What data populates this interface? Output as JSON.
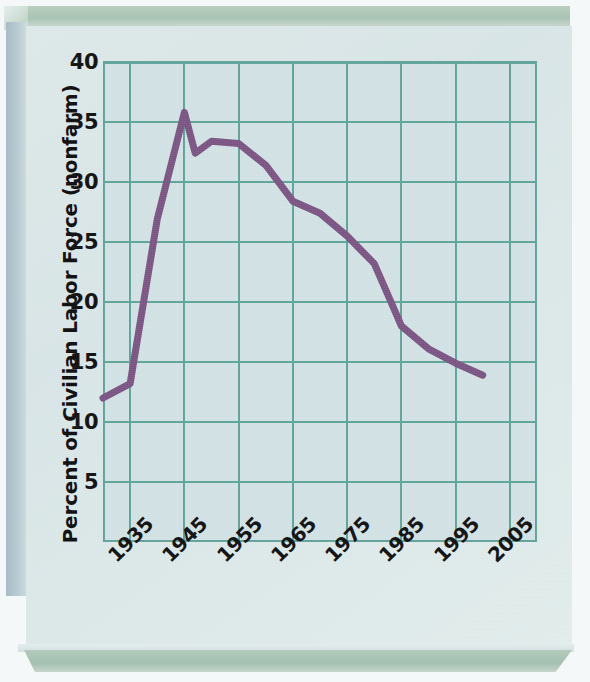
{
  "chart_data": {
    "type": "line",
    "title": "",
    "xlabel": "",
    "ylabel": "Percent of Civilian Labor Force (nonfarm)",
    "xlim": [
      1930,
      2010
    ],
    "ylim": [
      0,
      40
    ],
    "grid": true,
    "legend": "none",
    "line_color": "#7d5585",
    "line_width": 7,
    "x_ticks": [
      "1935",
      "1945",
      "1955",
      "1965",
      "1975",
      "1985",
      "1995",
      "2005"
    ],
    "x_tick_values": [
      1935,
      1945,
      1955,
      1965,
      1975,
      1985,
      1995,
      2005
    ],
    "y_ticks": [
      "5",
      "10",
      "15",
      "20",
      "25",
      "30",
      "35",
      "40"
    ],
    "y_tick_values": [
      5,
      10,
      15,
      20,
      25,
      30,
      35,
      40
    ],
    "series": [
      {
        "name": "Union membership",
        "x": [
          1930,
          1935,
          1940,
          1945,
          1947,
          1950,
          1955,
          1960,
          1965,
          1970,
          1975,
          1980,
          1983,
          1985,
          1990,
          1995,
          2000
        ],
        "y": [
          12.0,
          13.2,
          26.9,
          35.8,
          32.4,
          33.4,
          33.2,
          31.4,
          28.4,
          27.4,
          25.5,
          23.2,
          20.1,
          18.0,
          16.1,
          14.9,
          13.9
        ]
      }
    ]
  },
  "axes": {
    "y_title": "Percent of Civilian Labor Force (nonfarm)"
  },
  "colors": {
    "plot_background": "#d3e4e6",
    "grid_line": "#5fa59b",
    "axis_border": "#63a39c",
    "series_purple": "#7d5585",
    "card_background": "#dfeaea",
    "bevel_green": "#a9c4b4",
    "bevel_blue": "#a8bcc6"
  }
}
